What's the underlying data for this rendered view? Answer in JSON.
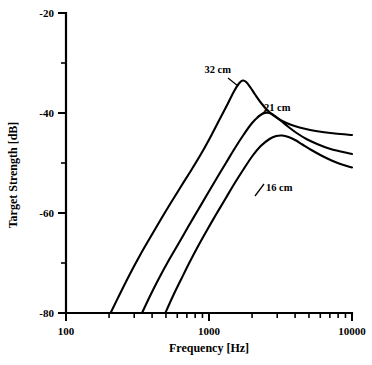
{
  "chart_data": {
    "type": "line",
    "title": "",
    "xlabel": "Frequency [Hz]",
    "ylabel": "Target Strength [dB]",
    "xscale": "log",
    "xlim": [
      100,
      10000
    ],
    "ylim": [
      -80,
      -20
    ],
    "grid": false,
    "legend_position": "inline-annotations",
    "x_tick_labels": [
      "100",
      "1000",
      "10000"
    ],
    "x_tick_values": [
      100,
      1000,
      10000
    ],
    "x_minor_ticks": [
      200,
      300,
      400,
      500,
      600,
      700,
      800,
      900,
      2000,
      3000,
      4000,
      5000,
      6000,
      7000,
      8000,
      9000
    ],
    "y_tick_labels": [
      "-20",
      "-40",
      "-60",
      "-80"
    ],
    "y_tick_values": [
      -20,
      -40,
      -60,
      -80
    ],
    "y_minor_ticks": [
      -30,
      -50,
      -70
    ],
    "annotations": [
      {
        "text": "32 cm",
        "x": 1150,
        "y": -32.0
      },
      {
        "text": "21 cm",
        "x": 3000,
        "y": -39.5
      },
      {
        "text": "16 cm",
        "x": 3100,
        "y": -55.5
      }
    ],
    "series": [
      {
        "name": "32 cm",
        "label": "32 cm",
        "color": "#000000",
        "points": [
          [
            205,
            -80.0
          ],
          [
            240,
            -76.0
          ],
          [
            280,
            -72.2
          ],
          [
            330,
            -68.4
          ],
          [
            390,
            -64.8
          ],
          [
            460,
            -61.3
          ],
          [
            540,
            -58.0
          ],
          [
            640,
            -54.6
          ],
          [
            760,
            -51.2
          ],
          [
            900,
            -47.7
          ],
          [
            1050,
            -44.2
          ],
          [
            1200,
            -41.0
          ],
          [
            1350,
            -38.2
          ],
          [
            1500,
            -35.6
          ],
          [
            1620,
            -34.1
          ],
          [
            1720,
            -33.5
          ],
          [
            1820,
            -33.8
          ],
          [
            1950,
            -34.9
          ],
          [
            2100,
            -36.3
          ],
          [
            2300,
            -37.9
          ],
          [
            2550,
            -39.4
          ],
          [
            2850,
            -40.6
          ],
          [
            3200,
            -41.5
          ],
          [
            3700,
            -42.3
          ],
          [
            4300,
            -42.9
          ],
          [
            5100,
            -43.4
          ],
          [
            6200,
            -43.8
          ],
          [
            7600,
            -44.1
          ],
          [
            10000,
            -44.4
          ]
        ]
      },
      {
        "name": "21 cm",
        "label": "21 cm",
        "color": "#000000",
        "points": [
          [
            340,
            -80.0
          ],
          [
            390,
            -76.4
          ],
          [
            450,
            -72.9
          ],
          [
            520,
            -69.6
          ],
          [
            610,
            -66.2
          ],
          [
            710,
            -62.9
          ],
          [
            830,
            -59.6
          ],
          [
            970,
            -56.3
          ],
          [
            1130,
            -53.1
          ],
          [
            1320,
            -49.9
          ],
          [
            1520,
            -47.0
          ],
          [
            1750,
            -44.3
          ],
          [
            2000,
            -42.0
          ],
          [
            2250,
            -40.6
          ],
          [
            2450,
            -40.0
          ],
          [
            2650,
            -40.0
          ],
          [
            2900,
            -40.6
          ],
          [
            3200,
            -41.6
          ],
          [
            3600,
            -42.8
          ],
          [
            4100,
            -44.0
          ],
          [
            4800,
            -45.2
          ],
          [
            5700,
            -46.2
          ],
          [
            6900,
            -47.1
          ],
          [
            8300,
            -47.7
          ],
          [
            10000,
            -48.2
          ]
        ]
      },
      {
        "name": "16 cm",
        "label": "16 cm",
        "color": "#000000",
        "points": [
          [
            495,
            -80.0
          ],
          [
            560,
            -76.6
          ],
          [
            640,
            -73.2
          ],
          [
            730,
            -69.9
          ],
          [
            840,
            -66.6
          ],
          [
            970,
            -63.4
          ],
          [
            1120,
            -60.3
          ],
          [
            1300,
            -57.2
          ],
          [
            1500,
            -54.2
          ],
          [
            1740,
            -51.3
          ],
          [
            2000,
            -48.7
          ],
          [
            2300,
            -46.6
          ],
          [
            2650,
            -45.2
          ],
          [
            2950,
            -44.6
          ],
          [
            3250,
            -44.5
          ],
          [
            3600,
            -44.8
          ],
          [
            4000,
            -45.4
          ],
          [
            4500,
            -46.3
          ],
          [
            5200,
            -47.4
          ],
          [
            6100,
            -48.5
          ],
          [
            7200,
            -49.5
          ],
          [
            8500,
            -50.3
          ],
          [
            10000,
            -50.9
          ]
        ]
      }
    ]
  }
}
